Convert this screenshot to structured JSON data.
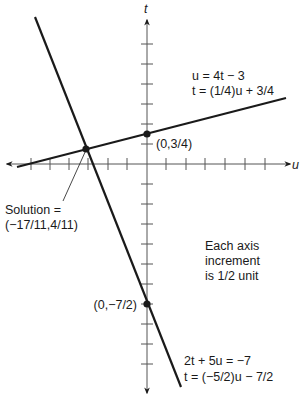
{
  "axes": {
    "horizontal_label": "u",
    "vertical_label": "t",
    "origin_px": [
      147,
      164
    ],
    "px_per_unit": 40,
    "tick_increment": 0.5
  },
  "lines": [
    {
      "name": "line-1",
      "eq1": "u = 4t − 3",
      "eq2": "t = (1/4)u + 3/4",
      "slope": 0.25,
      "intercept": 0.75,
      "intercept_label": "(0,3/4)"
    },
    {
      "name": "line-2",
      "eq1": "2t + 5u = −7",
      "eq2": "t = (−5/2)u − 7/2",
      "slope": -2.5,
      "intercept": -3.5,
      "intercept_label": "(0,−7/2)"
    }
  ],
  "solution": {
    "label_line1": "Solution =",
    "label_line2": "(−17/11,4/11)",
    "u": -1.5455,
    "t": 0.3636
  },
  "note": {
    "line1": "Each axis",
    "line2": "increment",
    "line3": "is 1/2 unit"
  },
  "colors": {
    "ink": "#1a1a1a",
    "background": "#ffffff"
  }
}
